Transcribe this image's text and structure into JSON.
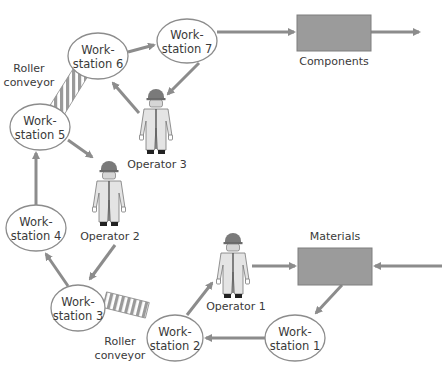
{
  "diagram": {
    "colors": {
      "arrow": "#8c8c8c",
      "box_fill": "#9b9b9b",
      "ellipse_stroke": "#8c8c8c",
      "text": "#3a3a3a",
      "operator_suit": "#e6e6e6",
      "operator_helmet": "#7a7a7a",
      "conveyor_stripe": "#9a9a9a"
    },
    "workstations": [
      {
        "id": "ws1",
        "line1": "Work-",
        "line2": "station 1",
        "cx": 295,
        "cy": 338,
        "rx": 30,
        "ry": 23
      },
      {
        "id": "ws2",
        "line1": "Work-",
        "line2": "station 2",
        "cx": 175,
        "cy": 338,
        "rx": 28,
        "ry": 23
      },
      {
        "id": "ws3",
        "line1": "Work-",
        "line2": "station 3",
        "cx": 78,
        "cy": 308,
        "rx": 27,
        "ry": 23
      },
      {
        "id": "ws4",
        "line1": "Work-",
        "line2": "station 4",
        "cx": 36,
        "cy": 228,
        "rx": 30,
        "ry": 23
      },
      {
        "id": "ws5",
        "line1": "Work-",
        "line2": "station 5",
        "cx": 40,
        "cy": 127,
        "rx": 30,
        "ry": 23
      },
      {
        "id": "ws6",
        "line1": "Work-",
        "line2": "station 6",
        "cx": 98,
        "cy": 56,
        "rx": 30,
        "ry": 23
      },
      {
        "id": "ws7",
        "line1": "Work-",
        "line2": "station 7",
        "cx": 187,
        "cy": 41,
        "rx": 30,
        "ry": 22
      }
    ],
    "boxes": [
      {
        "id": "components",
        "label": "Components",
        "x": 297,
        "y": 15,
        "w": 74,
        "h": 36,
        "label_x": 334,
        "label_y": 65
      },
      {
        "id": "materials",
        "label": "Materials",
        "x": 298,
        "y": 248,
        "w": 74,
        "h": 37,
        "label_x": 335,
        "label_y": 240
      }
    ],
    "operators": [
      {
        "id": "op1",
        "label": "Operator 1",
        "x": 215,
        "y": 232,
        "label_x": 236,
        "label_y": 310
      },
      {
        "id": "op2",
        "label": "Operator 2",
        "x": 91,
        "y": 160,
        "label_x": 110,
        "label_y": 240
      },
      {
        "id": "op3",
        "label": "Operator 3",
        "x": 138,
        "y": 88,
        "label_x": 157,
        "label_y": 168
      }
    ],
    "conveyors": [
      {
        "id": "conveyor-upper",
        "label_line1": "Roller",
        "label_line2": "conveyor",
        "label_x": 29,
        "label_y1": 72,
        "label_y2": 86
      },
      {
        "id": "conveyor-lower",
        "label_line1": "Roller",
        "label_line2": "conveyor",
        "label_x": 120,
        "label_y1": 345,
        "label_y2": 359
      }
    ],
    "flows": [
      {
        "from": "ws7",
        "to": "components",
        "path": "M217,32 L294,32"
      },
      {
        "from": "components",
        "to": "out",
        "path": "M371,32 L419,32"
      },
      {
        "from": "ws6",
        "to": "ws7",
        "path": "M128,52 L154,45"
      },
      {
        "from": "ws7",
        "to": "op3",
        "path": "M199,63 L168,94"
      },
      {
        "from": "op3",
        "to": "ws6",
        "path": "M139,113 L113,83"
      },
      {
        "from": "ws5",
        "to": "op2",
        "path": "M68,140 L92,157"
      },
      {
        "from": "ws4",
        "to": "ws5",
        "path": "M36,205 L36,153"
      },
      {
        "from": "op2",
        "to": "ws3",
        "path": "M115,245 L90,279"
      },
      {
        "from": "ws3",
        "to": "ws4",
        "path": "M68,286 L46,254"
      },
      {
        "from": "ws2",
        "to": "op1",
        "path": "M187,315 L212,283"
      },
      {
        "from": "op1",
        "to": "materials",
        "path": "M252,266 L295,266"
      },
      {
        "from": "in",
        "to": "materials",
        "path": "M442,266 L375,266"
      },
      {
        "from": "materials",
        "to": "ws1",
        "path": "M342,285 L316,313"
      },
      {
        "from": "ws1",
        "to": "ws2",
        "path": "M265,338 L206,338"
      }
    ]
  }
}
